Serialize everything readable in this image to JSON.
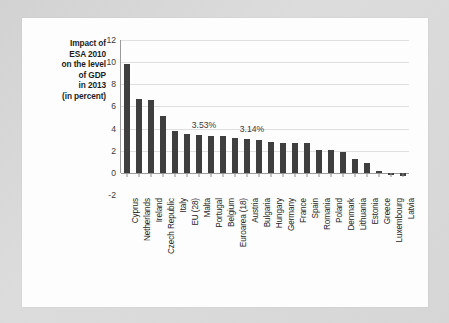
{
  "chart_data": {
    "type": "bar",
    "title_lines": [
      "Impact of",
      "ESA 2010",
      "on the level",
      "of GDP",
      "in 2013",
      "(in percent)"
    ],
    "xlabel": "",
    "ylabel": "",
    "ylim": [
      -2,
      12
    ],
    "yticks": [
      12,
      10,
      8,
      6,
      4,
      2,
      0,
      -2
    ],
    "ytick_labels": [
      "12",
      "10",
      "8",
      "6",
      "4",
      "2",
      "0",
      "-2"
    ],
    "grid": true,
    "legend": false,
    "bar_color": "#3f3f3f",
    "categories": [
      "Cyprus",
      "Netherlands",
      "Ireland",
      "Czech Republic",
      "Italy",
      "EU (28)",
      "Malta",
      "Portugal",
      "Belgium",
      "Euroarea (18)",
      "Austria",
      "Bulgaria",
      "Hungary",
      "Germany",
      "France",
      "Spain",
      "Romania",
      "Poland",
      "Denmark",
      "Lithuania",
      "Estonia",
      "Greece",
      "Luxembourg",
      "Latvia"
    ],
    "values": [
      9.8,
      6.7,
      6.55,
      5.15,
      3.75,
      3.53,
      3.4,
      3.35,
      3.3,
      3.14,
      3.05,
      2.95,
      2.75,
      2.72,
      2.7,
      2.68,
      2.1,
      2.05,
      1.9,
      1.25,
      0.85,
      0.2,
      -0.15,
      -0.25
    ],
    "annotations": [
      {
        "label": "3.53%",
        "category": "EU (28)",
        "value": 3.53
      },
      {
        "label": "3.14%",
        "category": "Euroarea (18)",
        "value": 3.14
      }
    ]
  }
}
